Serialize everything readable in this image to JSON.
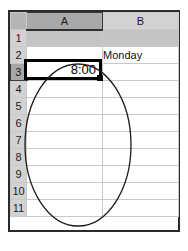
{
  "app": {
    "type": "spreadsheet",
    "corner_label": ""
  },
  "columns": [
    {
      "id": "A",
      "label": "A",
      "selected": true
    },
    {
      "id": "B",
      "label": "B",
      "selected": false
    }
  ],
  "rows": [
    {
      "num": "1",
      "selected": false,
      "shaded": true,
      "a": "",
      "b": ""
    },
    {
      "num": "2",
      "selected": false,
      "shaded": false,
      "a": "",
      "b": "Monday"
    },
    {
      "num": "3",
      "selected": true,
      "shaded": false,
      "a": "8:00",
      "b": ""
    },
    {
      "num": "4",
      "selected": false,
      "shaded": false,
      "a": "",
      "b": ""
    },
    {
      "num": "5",
      "selected": false,
      "shaded": false,
      "a": "",
      "b": ""
    },
    {
      "num": "6",
      "selected": false,
      "shaded": false,
      "a": "",
      "b": ""
    },
    {
      "num": "7",
      "selected": false,
      "shaded": false,
      "a": "",
      "b": ""
    },
    {
      "num": "8",
      "selected": false,
      "shaded": false,
      "a": "",
      "b": ""
    },
    {
      "num": "9",
      "selected": false,
      "shaded": false,
      "a": "",
      "b": ""
    },
    {
      "num": "10",
      "selected": false,
      "shaded": false,
      "a": "",
      "b": ""
    },
    {
      "num": "11",
      "selected": false,
      "shaded": false,
      "a": "",
      "b": ""
    }
  ],
  "active_cell": {
    "reference": "A3",
    "value": "8:00",
    "align": "right"
  },
  "annotation": {
    "shape": "ellipse",
    "stroke_color": "#1a1a1a",
    "fill": "none",
    "center_x": 78,
    "center_y": 145,
    "radius_x": 53,
    "radius_y": 81
  },
  "colors": {
    "header_fill": "#d2d2d2",
    "header_selected_fill": "#a9a9a9",
    "gridline": "#c9c9c9",
    "frame": "#2b2b2b",
    "shaded_row_fill": "#c4c4c4",
    "selection_border": "#000000",
    "cell_background": "#ffffff"
  }
}
